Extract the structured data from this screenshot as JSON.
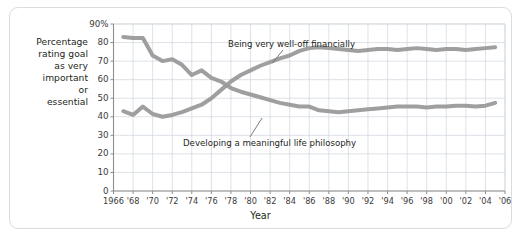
{
  "figure": {
    "kind": "line-chart-figure",
    "border_color": "#dcdcdc",
    "background": "#ffffff"
  },
  "axis_titles": {
    "y_lines": [
      "Percentage",
      "rating goal",
      "as very",
      "important",
      "or",
      "essential"
    ],
    "x": "Year"
  },
  "colors": {
    "line": "#9a9a9a",
    "grid": "#cfd6de",
    "axis": "#8d8d8d",
    "text": "#231f20",
    "tick_text": "#3b3b3b",
    "leader": "#6f6f6f"
  },
  "chart_data": {
    "type": "line",
    "title": "",
    "subtitle": "",
    "xlabel": "Year",
    "ylabel": "Percentage rating goal as very important or essential",
    "xlim": [
      1966,
      2006
    ],
    "ylim": [
      0,
      90
    ],
    "ytick_values": [
      0,
      10,
      20,
      30,
      40,
      50,
      60,
      70,
      80,
      90
    ],
    "ytick_labels": [
      "0",
      "10",
      "20",
      "30",
      "40",
      "50",
      "60",
      "70",
      "80",
      "90%"
    ],
    "xtick_values": [
      1966,
      1968,
      1970,
      1972,
      1974,
      1976,
      1978,
      1980,
      1982,
      1984,
      1986,
      1988,
      1990,
      1992,
      1994,
      1996,
      1998,
      2000,
      2002,
      2004,
      2006
    ],
    "xtick_labels": [
      "1966",
      "'68",
      "'70",
      "'72",
      "'74",
      "'76",
      "'78",
      "'80",
      "'82",
      "'84",
      "'86",
      "'88",
      "'90",
      "'92",
      "'94",
      "'96",
      "'98",
      "'00",
      "'02",
      "'04",
      "'06"
    ],
    "grid": true,
    "grid_x_step": 2,
    "grid_y_step": 10,
    "legend": "annotations-inline",
    "legend_position": "inline",
    "x": [
      1967,
      1968,
      1969,
      1970,
      1971,
      1972,
      1973,
      1974,
      1975,
      1976,
      1977,
      1978,
      1979,
      1980,
      1981,
      1982,
      1983,
      1984,
      1985,
      1986,
      1987,
      1988,
      1989,
      1990,
      1991,
      1992,
      1993,
      1994,
      1995,
      1996,
      1997,
      1998,
      1999,
      2000,
      2001,
      2002,
      2003,
      2004,
      2005
    ],
    "series": [
      {
        "name": "Developing a meaningful life philosophy",
        "color": "#9a9a9a",
        "values": [
          83,
          82.5,
          82.5,
          73,
          70,
          71,
          68,
          62.5,
          65,
          61,
          59,
          55.5,
          53.5,
          52,
          50.5,
          49,
          47.5,
          46.5,
          45.5,
          45.5,
          43.5,
          43,
          42.5,
          43,
          43.5,
          44,
          44.5,
          45,
          45.5,
          45.5,
          45.5,
          45,
          45.5,
          45.5,
          46,
          46,
          45.5,
          46,
          47.5
        ]
      },
      {
        "name": "Being very well-off financially",
        "color": "#9a9a9a",
        "values": [
          43,
          41,
          45.5,
          41.5,
          40,
          41,
          42.5,
          44.5,
          46.5,
          50,
          54.5,
          59,
          62.5,
          65,
          67.5,
          69.5,
          71.5,
          73,
          75.5,
          77,
          77.5,
          77,
          76.5,
          76,
          75.5,
          76,
          76.5,
          76.5,
          76,
          76.5,
          77,
          76.5,
          76,
          76.5,
          76.5,
          76,
          76.5,
          77,
          77.5
        ]
      }
    ],
    "annotations": [
      {
        "text": "Being very well-off financially",
        "target_series": "Being very well-off financially",
        "target_year": 1984,
        "target_value": 73
      },
      {
        "text": "Developing a meaningful life philosophy",
        "target_series": "Developing a meaningful life philosophy",
        "target_year": 1987,
        "target_value": 43.5
      }
    ]
  }
}
